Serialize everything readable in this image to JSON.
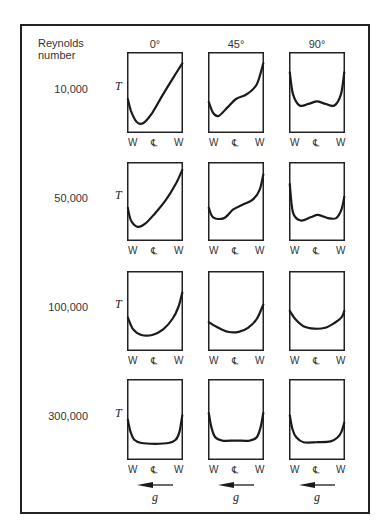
{
  "figure": {
    "row_header": [
      "Reynolds",
      "number"
    ],
    "column_headers": [
      "0°",
      "45°",
      "90°"
    ],
    "reynolds_numbers": [
      "10,000",
      "50,000",
      "100,000",
      "300,000"
    ],
    "y_axis_label": "T",
    "x_axis_labels": [
      "W",
      "℄",
      "W"
    ],
    "gravity_label": "g",
    "gravity_arrow": "arrow-left"
  },
  "chart_data": {
    "type": "line",
    "xlabel": "Position (W – centerline ℄ – W)",
    "ylabel": "T",
    "columns": [
      "0°",
      "45°",
      "90°"
    ],
    "rows": [
      "10,000",
      "50,000",
      "100,000",
      "300,000"
    ],
    "note": "Curves are qualitative; x from 0 (left wall) to 1 (right wall), y from 0 (bottom) to 1 (top of box).",
    "panels": [
      [
        {
          "x": [
            0,
            0.05,
            0.15,
            0.28,
            0.45,
            0.65,
            0.85,
            1.0
          ],
          "y": [
            0.4,
            0.25,
            0.12,
            0.1,
            0.22,
            0.45,
            0.7,
            0.88
          ]
        },
        {
          "x": [
            0,
            0.04,
            0.12,
            0.25,
            0.45,
            0.65,
            0.85,
            1.0
          ],
          "y": [
            0.4,
            0.58,
            0.82,
            0.88,
            0.8,
            0.56,
            0.3,
            0.0
          ]
        },
        {
          "x": [
            0,
            0.12,
            0.4,
            1.0
          ],
          "y": [
            0,
            0,
            0,
            0
          ]
        },
        {
          "x": [
            0,
            0.12,
            0.4,
            1.0
          ],
          "y": [
            0,
            0,
            0,
            0
          ]
        }
      ],
      [
        {
          "x": [
            0,
            0.06,
            0.18,
            0.35,
            0.55,
            0.75,
            0.9,
            1.0
          ],
          "y": [
            0.4,
            0.22,
            0.18,
            0.32,
            0.4,
            0.52,
            0.72,
            0.9
          ]
        },
        {
          "x": [
            0,
            0.06,
            0.18,
            0.35,
            0.55,
            0.75,
            0.9,
            1.0
          ],
          "y": [
            0.4,
            0.26,
            0.21,
            0.37,
            0.42,
            0.48,
            0.62,
            0.83
          ]
        },
        {
          "x": [
            0,
            0.15,
            0.5,
            0.85,
            1.0
          ],
          "y": [
            0,
            0,
            0,
            0,
            0
          ]
        },
        {
          "x": [
            0,
            0.15,
            0.5,
            0.85,
            1.0
          ],
          "y": [
            0,
            0,
            0,
            0,
            0
          ]
        }
      ],
      [
        {
          "x": [
            0,
            0.05,
            0.18,
            0.35,
            0.5,
            0.65,
            0.82,
            0.95,
            1.0
          ],
          "y": [
            0.78,
            0.45,
            0.24,
            0.26,
            0.3,
            0.26,
            0.24,
            0.45,
            0.78
          ]
        },
        {
          "x": [
            0,
            0.05,
            0.18,
            0.35,
            0.5,
            0.65,
            0.82,
            0.95,
            1.0
          ],
          "y": [
            0.78,
            0.45,
            0.28,
            0.3,
            0.34,
            0.3,
            0.28,
            0.45,
            0.58
          ]
        },
        {
          "x": [
            0,
            0.15,
            0.5,
            0.85,
            1.0
          ],
          "y": [
            0,
            0,
            0,
            0,
            0
          ]
        },
        {
          "x": [
            0,
            0.15,
            0.5,
            0.85,
            1.0
          ],
          "y": [
            0,
            0,
            0,
            0,
            0
          ]
        }
      ]
    ]
  }
}
